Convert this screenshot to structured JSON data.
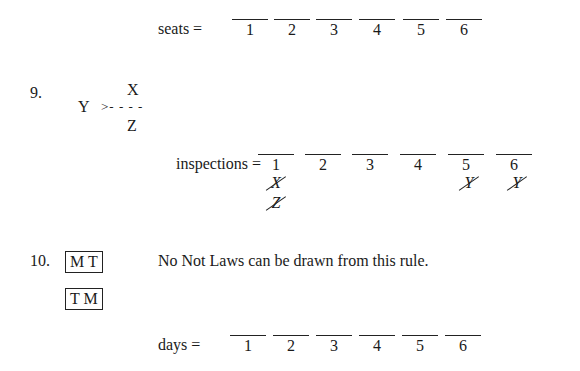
{
  "seats_row": {
    "label": "seats =",
    "slots": [
      "1",
      "2",
      "3",
      "4",
      "5",
      "6"
    ]
  },
  "rule9": {
    "number": "9.",
    "top_var": "X",
    "left_var": "Y",
    "connector": ">- - - -",
    "bottom_var": "Z",
    "row_label": "inspections =",
    "slots": [
      "1",
      "2",
      "3",
      "4",
      "5",
      "6"
    ],
    "not_laws": [
      {
        "slot": "1",
        "marks": [
          "X",
          "Z"
        ]
      },
      {
        "slot": "5",
        "marks": [
          "Y"
        ]
      },
      {
        "slot": "6",
        "marks": [
          "Y"
        ]
      }
    ]
  },
  "rule10": {
    "number": "10.",
    "block1": "M T",
    "block2": "T M",
    "note": "No Not Laws can be drawn from this rule.",
    "row_label": "days =",
    "slots": [
      "1",
      "2",
      "3",
      "4",
      "5",
      "6"
    ]
  }
}
